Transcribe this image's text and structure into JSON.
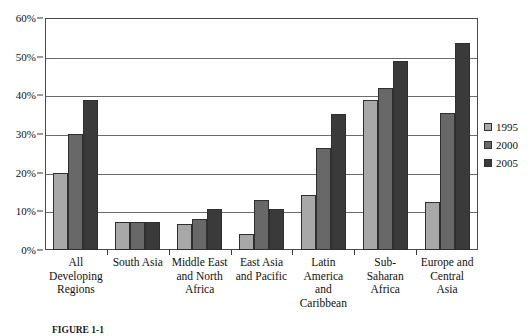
{
  "chart_data": {
    "type": "bar",
    "title": "",
    "xlabel": "",
    "ylabel": "",
    "ylim": [
      0,
      60
    ],
    "ytick_values": [
      0,
      10,
      20,
      30,
      40,
      50,
      60
    ],
    "ytick_labels": [
      "0%",
      "10%",
      "20%",
      "30%",
      "40%",
      "50%",
      "60%"
    ],
    "grid": true,
    "legend_position": "right",
    "categories": [
      "All\nDeveloping\nRegions",
      "South Asia",
      "Middle East\nand North\nAfrica",
      "East Asia\nand Pacific",
      "Latin\nAmerica\nand\nCaribbean",
      "Sub-\nSaharan\nAfrica",
      "Europe and\nCentral\nAsia"
    ],
    "series": [
      {
        "name": "1995",
        "color": "#a8a8a8",
        "values": [
          20.0,
          7.2,
          6.6,
          4.1,
          14.1,
          38.8,
          12.3
        ]
      },
      {
        "name": "2000",
        "color": "#686868",
        "values": [
          30.0,
          7.3,
          7.9,
          12.9,
          26.5,
          42.0,
          35.5
        ]
      },
      {
        "name": "2005",
        "color": "#3a3a3a",
        "values": [
          38.9,
          7.3,
          10.6,
          10.7,
          35.1,
          48.8,
          53.6
        ]
      }
    ]
  },
  "legend": {
    "entries": [
      {
        "label": "1995",
        "color": "#a8a8a8"
      },
      {
        "label": "2000",
        "color": "#686868"
      },
      {
        "label": "2005",
        "color": "#3a3a3a"
      }
    ]
  },
  "caption": {
    "text": "FIGURE 1-1"
  },
  "colors": {
    "axis": "#4a4a4a",
    "grid": "#6b6b6b",
    "bar_outline": "#2f2f2f",
    "background": "#ffffff"
  }
}
